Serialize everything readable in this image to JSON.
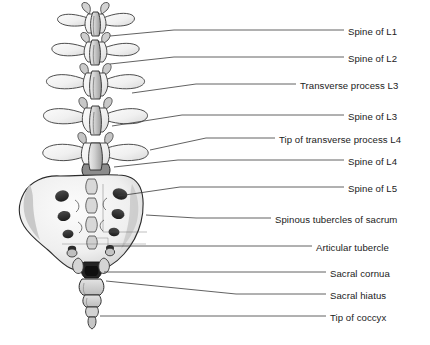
{
  "figure": {
    "illustration_name": "lumbar-spine-sacrum-coccyx-posterior",
    "background_color": "#ffffff",
    "ink_color": "#1b1b1b",
    "leader_line_color": "#3a3a3a",
    "shading_style": "grayscale-pencil"
  },
  "labels": [
    {
      "id": "spine-of-l1",
      "text": "Spine of L1",
      "text_x": 348,
      "text_y": 26,
      "leader": "M110,36 L174,30 L344,30"
    },
    {
      "id": "spine-of-l2",
      "text": "Spine of L2",
      "text_x": 348,
      "text_y": 53,
      "leader": "M110,64 L174,57 L344,57"
    },
    {
      "id": "transverse-process-l3",
      "text": "Transverse process L3",
      "text_x": 300,
      "text_y": 80,
      "leader": "M132,93 L196,84 L296,84"
    },
    {
      "id": "spine-of-l3",
      "text": "Spine of L3",
      "text_x": 348,
      "text_y": 111,
      "leader": "M112,126 L182,115 L344,115"
    },
    {
      "id": "tip-of-transverse-process-l4",
      "text": "Tip of transverse process L4",
      "text_x": 279,
      "text_y": 134,
      "leader": "M150,150 L206,138 L275,138"
    },
    {
      "id": "spine-of-l4",
      "text": "Spine of L4",
      "text_x": 348,
      "text_y": 156,
      "leader": "M114,167 L178,160 L344,160"
    },
    {
      "id": "spine-of-l5",
      "text": "Spine of L5",
      "text_x": 348,
      "text_y": 183,
      "leader": "M118,196 L180,187 L344,187"
    },
    {
      "id": "spinous-tubercles-of-sacrum",
      "text": "Spinous tubercles of sacrum",
      "text_x": 275,
      "text_y": 214,
      "leader": "M146,215 L196,218 L271,218"
    },
    {
      "id": "articular-tubercle",
      "text": "Articular tubercle",
      "text_x": 316,
      "text_y": 242,
      "leader": "M110,246 L240,246 L312,246"
    },
    {
      "id": "sacral-cornua",
      "text": "Sacral cornua",
      "text_x": 330,
      "text_y": 268,
      "leader": "M104,272 L232,272 L326,272"
    },
    {
      "id": "sacral-hiatus",
      "text": "Sacral hiatus",
      "text_x": 330,
      "text_y": 290,
      "leader": "M106,281 L236,294 L326,294"
    },
    {
      "id": "tip-of-coccyx",
      "text": "Tip of coccyx",
      "text_x": 330,
      "text_y": 312,
      "leader": "M100,316 L230,316 L326,316"
    }
  ],
  "anatomy_parts": [
    {
      "name": "l1-vertebra",
      "region": "lumbar"
    },
    {
      "name": "l2-vertebra",
      "region": "lumbar"
    },
    {
      "name": "l3-vertebra",
      "region": "lumbar"
    },
    {
      "name": "l4-vertebra",
      "region": "lumbar"
    },
    {
      "name": "l5-vertebra",
      "region": "lumbar"
    },
    {
      "name": "sacrum",
      "region": "sacral"
    },
    {
      "name": "coccyx",
      "region": "coccygeal"
    }
  ]
}
